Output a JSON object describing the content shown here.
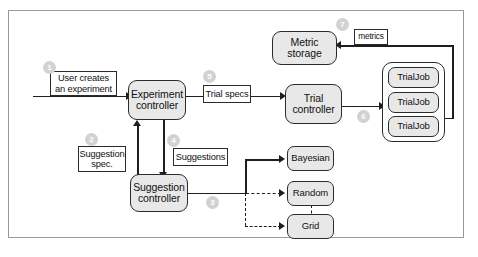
{
  "diagram": {
    "type": "flow-architecture",
    "nodes": [
      {
        "id": "experiment_controller",
        "label": "Experiment\ncontroller",
        "line1": "Experiment",
        "line2": "controller"
      },
      {
        "id": "trial_controller",
        "label": "Trial\ncontroller",
        "line1": "Trial",
        "line2": "controller"
      },
      {
        "id": "suggestion_controller",
        "label": "Suggestion\ncontroller",
        "line1": "Suggestion",
        "line2": "controller"
      },
      {
        "id": "metric_storage",
        "label": "Metric storage"
      },
      {
        "id": "bayesian",
        "label": "Bayesian"
      },
      {
        "id": "random",
        "label": "Random"
      },
      {
        "id": "grid",
        "label": "Grid"
      },
      {
        "id": "trialjob_1",
        "label": "TrialJob"
      },
      {
        "id": "trialjob_2",
        "label": "TrialJob"
      },
      {
        "id": "trialjob_3",
        "label": "TrialJob"
      }
    ],
    "labels": [
      {
        "id": "user_creates",
        "line1": "User creates",
        "line2": "an experiment"
      },
      {
        "id": "trial_specs",
        "text": "Trial specs"
      },
      {
        "id": "metrics",
        "text": "metrics"
      },
      {
        "id": "suggestion_spec",
        "line1": "Suggestion",
        "line2": "spec."
      },
      {
        "id": "suggestions",
        "text": "Suggestions"
      }
    ],
    "badges": [
      {
        "id": "step-1",
        "number": "1"
      },
      {
        "id": "step-2",
        "number": "2"
      },
      {
        "id": "step-3",
        "number": "3"
      },
      {
        "id": "step-4",
        "number": "4"
      },
      {
        "id": "step-5",
        "number": "5"
      },
      {
        "id": "step-6",
        "number": "6"
      },
      {
        "id": "step-7",
        "number": "7"
      }
    ],
    "colors": {
      "node_fill": "#e8e8e8",
      "node_stroke": "#2b2b2b",
      "label_fill": "#ffffff",
      "connector": "#1e1e1e",
      "badge_fill": "#d2d2d2",
      "frame_border": "#9a9a9a",
      "background": "#ffffff"
    }
  }
}
